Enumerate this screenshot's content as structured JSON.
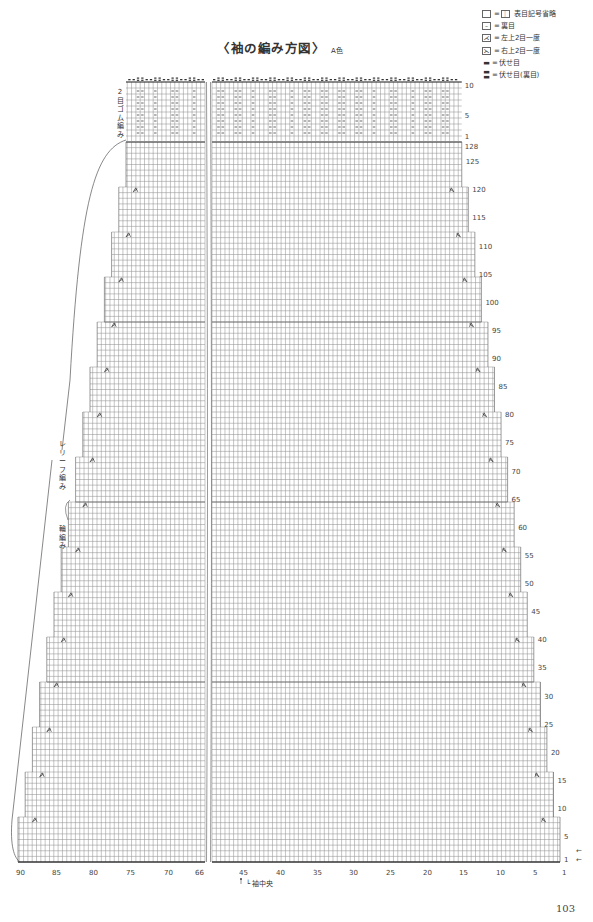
{
  "title": {
    "main": "〈袖の編み方図〉",
    "color_note": "A色"
  },
  "legend": [
    {
      "symbol": "blank-box",
      "equals_symbol": "｜",
      "label": "表目記号省略"
    },
    {
      "symbol": "dash-box",
      "label": "裏目"
    },
    {
      "symbol": "left-decrease",
      "label": "左上2目一度"
    },
    {
      "symbol": "right-decrease",
      "label": "右上2目一度"
    },
    {
      "symbol": "bind-off",
      "label": "伏せ目"
    },
    {
      "symbol": "bind-off-purl",
      "label": "伏せ目(裏目)"
    }
  ],
  "side_labels": {
    "rib": "2目ゴム編み",
    "relief": "レリーフ編み",
    "ring": "輪編み"
  },
  "sleeve_center_label": "袖中央",
  "page_number": "103",
  "chart": {
    "total_stitches_shown": 90,
    "main_rows": 128,
    "rib_rows": 10,
    "column_ticks": [
      "90",
      "85",
      "80",
      "75",
      "70",
      "66",
      "45",
      "40",
      "35",
      "30",
      "25",
      "20",
      "15",
      "10",
      "5",
      "1"
    ],
    "row_ticks_main": [
      "1",
      "5",
      "10",
      "15",
      "20",
      "25",
      "30",
      "35",
      "40",
      "45",
      "50",
      "55",
      "60",
      "65",
      "70",
      "75",
      "80",
      "85",
      "90",
      "95",
      "100",
      "105",
      "110",
      "115",
      "120",
      "125",
      "128"
    ],
    "row_ticks_rib": [
      "1",
      "5",
      "10"
    ],
    "direction_arrows": [
      "←",
      "←"
    ],
    "decrease_rows": [
      8,
      16,
      24,
      32,
      40,
      48,
      56,
      64,
      72,
      80,
      88,
      96,
      104,
      112,
      120
    ],
    "colors": {
      "grid": "#8a8a8a",
      "outline": "#555555",
      "text": "#444444"
    }
  }
}
